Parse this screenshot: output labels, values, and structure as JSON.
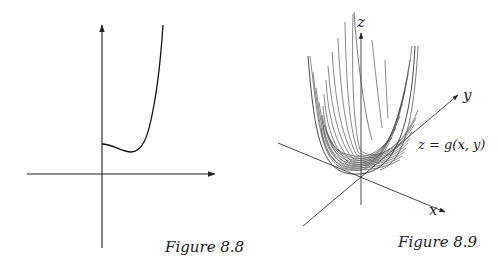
{
  "figures": [
    {
      "id": "fig-8-8",
      "caption": "Figure 8.8",
      "description": "Graph of a single-variable function with a slight dip just right of the y-axis, then rising steeply",
      "axes": {
        "x_label": "",
        "y_label": ""
      }
    },
    {
      "id": "fig-8-9",
      "caption": "Figure 8.9",
      "description": "3D surface plot of a bowl-shaped function drawn as a family of curves",
      "axes": {
        "x_label": "x",
        "y_label": "y",
        "z_label": "z"
      },
      "surface_label": "z = g(x, y)"
    }
  ],
  "colors": {
    "ink": "#222222",
    "surface_lines": "#555555",
    "background": "#ffffff"
  }
}
